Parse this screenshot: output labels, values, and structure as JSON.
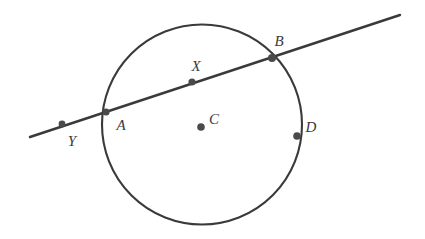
{
  "figure": {
    "type": "geometry-diagram",
    "canvas": {
      "width": 425,
      "height": 239,
      "background": "#ffffff"
    },
    "colors": {
      "stroke": "#3a3a3a",
      "point_fill": "#4a4a4a",
      "label_color": "#3a3a3a",
      "background": "#ffffff"
    },
    "circle": {
      "name": "main-circle",
      "center_x": 202,
      "center_y": 124.5,
      "radius": 100,
      "stroke_width": 2.1
    },
    "secant_line": {
      "name": "secant-line",
      "x1": 30,
      "y1": 137,
      "x2": 400,
      "y2": 15,
      "stroke_width": 2.4
    },
    "points": [
      {
        "id": "Y",
        "label": "Y",
        "x": 62,
        "y": 124,
        "radius": 3.4,
        "label_x": 72,
        "label_y": 141,
        "on_line": true,
        "on_circle": false
      },
      {
        "id": "A",
        "label": "A",
        "x": 106,
        "y": 112,
        "radius": 3.6,
        "label_x": 121,
        "label_y": 125,
        "on_line": true,
        "on_circle": true
      },
      {
        "id": "X",
        "label": "X",
        "x": 192,
        "y": 82,
        "radius": 3.6,
        "label_x": 196,
        "label_y": 66,
        "on_line": true,
        "on_circle": false
      },
      {
        "id": "C",
        "label": "C",
        "x": 201,
        "y": 127,
        "radius": 3.8,
        "label_x": 214,
        "label_y": 119,
        "on_line": false,
        "on_circle": false
      },
      {
        "id": "B",
        "label": "B",
        "x": 272,
        "y": 58,
        "radius": 4.0,
        "label_x": 279,
        "label_y": 41,
        "on_line": true,
        "on_circle": true
      },
      {
        "id": "D",
        "label": "D",
        "x": 297,
        "y": 136,
        "radius": 3.8,
        "label_x": 311,
        "label_y": 127,
        "on_line": false,
        "on_circle": true
      }
    ]
  }
}
